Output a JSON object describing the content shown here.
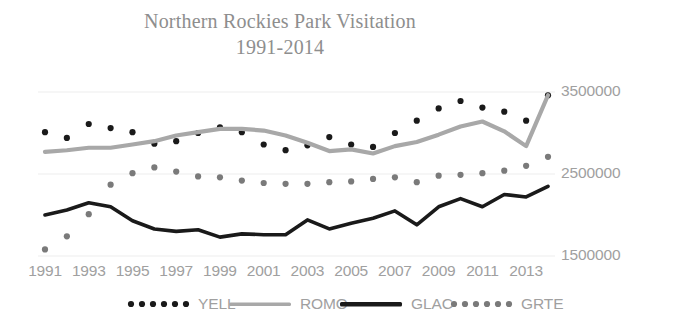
{
  "chart_data": {
    "type": "line",
    "title": "Northern Rockies Park Visitation",
    "subtitle": "1991-2014",
    "xlabel": "",
    "ylabel": "",
    "grid": true,
    "legend_position": "bottom",
    "ylim": [
      1500000,
      3500000
    ],
    "yticks": [
      1500000,
      2500000,
      3500000
    ],
    "ytick_labels": [
      "1500000",
      "2500000",
      "3500000"
    ],
    "x": [
      1991,
      1992,
      1993,
      1994,
      1995,
      1996,
      1997,
      1998,
      1999,
      2000,
      2001,
      2002,
      2003,
      2004,
      2005,
      2006,
      2007,
      2008,
      2009,
      2010,
      2011,
      2012,
      2013,
      2014
    ],
    "xtick_labels": [
      "1991",
      "1993",
      "1995",
      "1997",
      "1999",
      "2001",
      "2003",
      "2005",
      "2007",
      "2009",
      "2011",
      "2013"
    ],
    "series": [
      {
        "name": "YELL",
        "style": "dotted",
        "color": "#1a1a1a",
        "values": [
          3010000,
          2940000,
          3110000,
          3060000,
          3010000,
          2870000,
          2900000,
          3000000,
          3070000,
          3010000,
          2860000,
          2790000,
          2850000,
          2950000,
          2860000,
          2830000,
          3000000,
          3150000,
          3300000,
          3390000,
          3310000,
          3260000,
          3150000,
          3460000
        ]
      },
      {
        "name": "ROMO",
        "style": "solid",
        "color": "#a8a8a8",
        "values": [
          2770000,
          2790000,
          2820000,
          2820000,
          2860000,
          2900000,
          2970000,
          3010000,
          3050000,
          3050000,
          3030000,
          2970000,
          2880000,
          2780000,
          2800000,
          2750000,
          2840000,
          2890000,
          2980000,
          3080000,
          3140000,
          3020000,
          2840000,
          3460000
        ]
      },
      {
        "name": "GLAC",
        "style": "solid",
        "color": "#1a1a1a",
        "values": [
          2000000,
          2060000,
          2150000,
          2100000,
          1930000,
          1830000,
          1800000,
          1820000,
          1730000,
          1770000,
          1760000,
          1760000,
          1940000,
          1830000,
          1900000,
          1960000,
          2050000,
          1880000,
          2100000,
          2200000,
          2100000,
          2250000,
          2220000,
          2350000
        ]
      },
      {
        "name": "GRTE",
        "style": "dotted",
        "color": "#7a7a7a",
        "values": [
          1580000,
          1740000,
          2010000,
          2370000,
          2510000,
          2580000,
          2530000,
          2470000,
          2460000,
          2420000,
          2390000,
          2380000,
          2380000,
          2400000,
          2410000,
          2440000,
          2460000,
          2400000,
          2480000,
          2490000,
          2510000,
          2540000,
          2600000,
          2710000
        ]
      }
    ],
    "legend": [
      {
        "label": "YELL",
        "marker": "dotted-line",
        "color": "#1a1a1a"
      },
      {
        "label": "ROMO",
        "marker": "solid-line",
        "color": "#a8a8a8"
      },
      {
        "label": "GLAC",
        "marker": "solid-line-thick",
        "color": "#1a1a1a"
      },
      {
        "label": "GRTE",
        "marker": "dotted-line",
        "color": "#7a7a7a"
      }
    ],
    "colors": {
      "background": "#ffffff",
      "title": "#8e8e8e",
      "axis_text": "#a0a0a0",
      "gridline": "#ededed",
      "yell": "#1a1a1a",
      "romo": "#a8a8a8",
      "glac": "#1a1a1a",
      "grte": "#7a7a7a"
    }
  },
  "title": {
    "line1": "Northern Rockies Park Visitation",
    "line2": "1991-2014"
  },
  "y_axis": {
    "ticks": [
      {
        "label": "3500000",
        "value": 3500000
      },
      {
        "label": "2500000",
        "value": 2500000
      },
      {
        "label": "1500000",
        "value": 1500000
      }
    ]
  },
  "x_axis": {
    "ticks": [
      {
        "label": "1991",
        "value": 1991
      },
      {
        "label": "1993",
        "value": 1993
      },
      {
        "label": "1995",
        "value": 1995
      },
      {
        "label": "1997",
        "value": 1997
      },
      {
        "label": "1999",
        "value": 1999
      },
      {
        "label": "2001",
        "value": 2001
      },
      {
        "label": "2003",
        "value": 2003
      },
      {
        "label": "2005",
        "value": 2005
      },
      {
        "label": "2007",
        "value": 2007
      },
      {
        "label": "2009",
        "value": 2009
      },
      {
        "label": "2011",
        "value": 2011
      },
      {
        "label": "2013",
        "value": 2013
      }
    ]
  },
  "legend": {
    "items": [
      {
        "label": "YELL"
      },
      {
        "label": "ROMO"
      },
      {
        "label": "GLAC"
      },
      {
        "label": "GRTE"
      }
    ]
  }
}
